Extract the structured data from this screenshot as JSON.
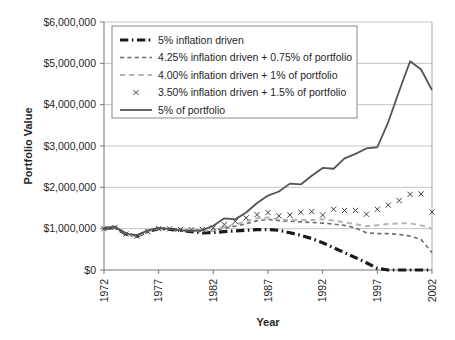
{
  "chart_data": {
    "type": "line",
    "title": "",
    "xlabel": "Year",
    "ylabel": "Portfolio Value",
    "xlim": [
      1972,
      2002
    ],
    "ylim": [
      0,
      6000000
    ],
    "grid": true,
    "legend_position": "top-left-inside",
    "y_ticks": [
      0,
      1000000,
      2000000,
      3000000,
      4000000,
      5000000,
      6000000
    ],
    "y_tick_labels": [
      "$0",
      "$1,000,000",
      "$2,000,000",
      "$3,000,000",
      "$4,000,000",
      "$5,000,000",
      "$6,000,000"
    ],
    "x_ticks": [
      1972,
      1977,
      1982,
      1987,
      1992,
      1997,
      2002
    ],
    "x_tick_labels": [
      "1972",
      "1977",
      "1982",
      "1987",
      "1992",
      "1997",
      "2002"
    ],
    "x": [
      1972,
      1973,
      1974,
      1975,
      1976,
      1977,
      1978,
      1979,
      1980,
      1981,
      1982,
      1983,
      1984,
      1985,
      1986,
      1987,
      1988,
      1989,
      1990,
      1991,
      1992,
      1993,
      1994,
      1995,
      1996,
      1997,
      1998,
      1999,
      2000,
      2001,
      2002
    ],
    "series": [
      {
        "name": "5% inflation driven",
        "color": "#1a1a1a",
        "style": "dash-dot",
        "width": 3.2,
        "marker": "none",
        "values": [
          1000000,
          1030000,
          870000,
          820000,
          930000,
          1000000,
          985000,
          960000,
          930000,
          900000,
          905000,
          930000,
          945000,
          960000,
          975000,
          980000,
          960000,
          900000,
          840000,
          760000,
          660000,
          540000,
          420000,
          300000,
          175000,
          40000,
          0,
          0,
          0,
          0,
          0
        ]
      },
      {
        "name": "4.25% inflation driven + 0.75% of portfolio",
        "color": "#6e6e6e",
        "style": "dashed",
        "width": 1.6,
        "marker": "none",
        "values": [
          1000000,
          1030000,
          870000,
          820000,
          930000,
          1000000,
          985000,
          965000,
          945000,
          930000,
          950000,
          1010000,
          1060000,
          1120000,
          1190000,
          1225000,
          1195000,
          1180000,
          1165000,
          1150000,
          1135000,
          1110000,
          1080000,
          1020000,
          900000,
          880000,
          880000,
          860000,
          820000,
          740000,
          420000
        ]
      },
      {
        "name": "4.00% inflation driven + 1% of portfolio",
        "color": "#b5b5b5",
        "style": "dashed",
        "width": 2.0,
        "marker": "none",
        "values": [
          1000000,
          1030000,
          870000,
          820000,
          930000,
          1000000,
          990000,
          970000,
          955000,
          945000,
          970000,
          1040000,
          1100000,
          1175000,
          1250000,
          1270000,
          1220000,
          1215000,
          1205000,
          1210000,
          1230000,
          1195000,
          1155000,
          1110000,
          1060000,
          1085000,
          1110000,
          1130000,
          1130000,
          1080000,
          1000000
        ]
      },
      {
        "name": "3.50% inflation driven + 1.5% of portfolio",
        "color": "#3d3d3d",
        "style": "none",
        "width": 0,
        "marker": "x",
        "values": [
          1000000,
          1030000,
          870000,
          820000,
          930000,
          1000000,
          995000,
          980000,
          975000,
          980000,
          1020000,
          1100000,
          1175000,
          1260000,
          1340000,
          1390000,
          1310000,
          1330000,
          1400000,
          1415000,
          1330000,
          1470000,
          1440000,
          1440000,
          1350000,
          1470000,
          1570000,
          1680000,
          1830000,
          1840000,
          1400000
        ]
      },
      {
        "name": "5% of portfolio",
        "color": "#545454",
        "style": "solid",
        "width": 1.8,
        "marker": "none",
        "values": [
          1000000,
          1050000,
          880000,
          840000,
          960000,
          1020000,
          995000,
          960000,
          950000,
          965000,
          1070000,
          1250000,
          1225000,
          1390000,
          1620000,
          1800000,
          1900000,
          2090000,
          2070000,
          2280000,
          2470000,
          2450000,
          2700000,
          2810000,
          2940000,
          2970000,
          3580000,
          4330000,
          5050000,
          4850000,
          4350000
        ]
      }
    ]
  }
}
